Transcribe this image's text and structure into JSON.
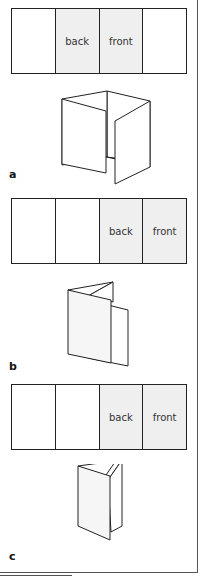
{
  "figures": [
    {
      "id": "a",
      "label": "a",
      "panels": [
        {
          "text": "",
          "shaded": false
        },
        {
          "text": "back",
          "shaded": true
        },
        {
          "text": "front",
          "shaded": true
        },
        {
          "text": "",
          "shaded": false
        }
      ],
      "fold_style": "gate fold"
    },
    {
      "id": "b",
      "label": "b",
      "panels": [
        {
          "text": "",
          "shaded": false
        },
        {
          "text": "",
          "shaded": false
        },
        {
          "text": "back",
          "shaded": true
        },
        {
          "text": "front",
          "shaded": true
        }
      ],
      "fold_style": "accordion fold"
    },
    {
      "id": "c",
      "label": "c",
      "panels": [
        {
          "text": "",
          "shaded": false
        },
        {
          "text": "",
          "shaded": false
        },
        {
          "text": "back",
          "shaded": true
        },
        {
          "text": "front",
          "shaded": true
        }
      ],
      "fold_style": "roll fold"
    }
  ],
  "colors": {
    "stroke": "#222222",
    "shaded_panel": "#efefef",
    "background": "#ffffff"
  }
}
